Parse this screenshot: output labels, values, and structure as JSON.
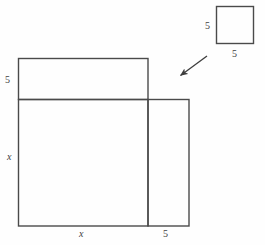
{
  "figure": {
    "stroke_color": "#4a4a4a",
    "background_color": "#fefefe",
    "small_square": {
      "name": "detached 5 by 5 square",
      "label_left": "5",
      "label_bottom": "5",
      "x": 216,
      "y": 6,
      "width": 37,
      "height": 37
    },
    "arrow": {
      "name": "pointer from small square to assembly",
      "tail_x": 207,
      "tail_y": 56,
      "head_x": 177,
      "head_y": 78
    },
    "top_strip": {
      "name": "horizontal strip of height 5",
      "label_left": "5",
      "x": 18,
      "y": 58,
      "width": 130,
      "height": 41
    },
    "core_square": {
      "name": "central square of side x",
      "label_left": "x",
      "label_bottom": "x",
      "x": 18,
      "y": 99,
      "width": 130,
      "height": 127
    },
    "right_strip": {
      "name": "vertical strip of width 5",
      "label_bottom": "5",
      "x": 148,
      "y": 99,
      "width": 41,
      "height": 127
    }
  }
}
